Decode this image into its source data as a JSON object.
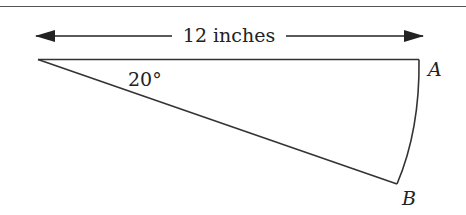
{
  "diagram": {
    "dimension_label": "12 inches",
    "angle_label": "20°",
    "point_a_label": "A",
    "point_b_label": "B",
    "radius_inches": 12,
    "angle_degrees": 20
  },
  "colors": {
    "stroke": "#333333",
    "text": "#222222",
    "background": "#ffffff"
  }
}
